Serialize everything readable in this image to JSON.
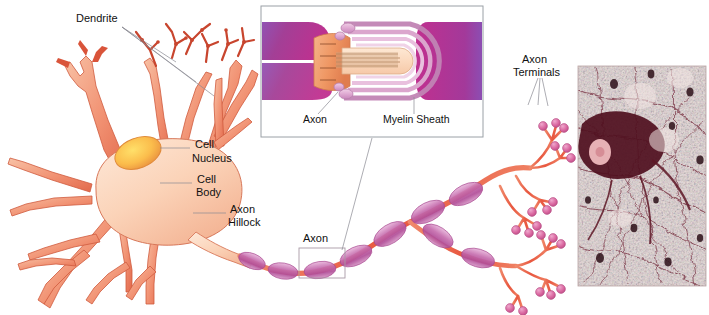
{
  "figure": {
    "background_color": "#ffffff",
    "width": 709,
    "height": 315
  },
  "labels": {
    "dendrite": "Dendrite",
    "cell_nucleus_line1": "Cell",
    "cell_nucleus_line2": "Nucleus",
    "cell_body_line1": "Cell",
    "cell_body_line2": "Body",
    "axon_hillock_line1": "Axon",
    "axon_hillock_line2": "Hillock",
    "axon_callout": "Axon",
    "axon_terminals_line1": "Axon",
    "axon_terminals_line2": "Terminals",
    "inset_axon": "Axon",
    "inset_myelin_sheath": "Myelin Sheath"
  },
  "colors": {
    "soma_fill_light": "#fbd9c4",
    "soma_fill_mid": "#f6bda0",
    "dendrite": "#ef8466",
    "dendrite_dark": "#d9543a",
    "nucleus_outer": "#f0a355",
    "nucleus_inner": "#ffd24a",
    "myelin_segment": "#c466a8",
    "myelin_segment_light": "#e3aed2",
    "axon_red": "#e8604a",
    "terminal_bulb": "#d9669f",
    "inset_myelin_dark": "#b2338c",
    "inset_myelin_purple": "#8b52b5",
    "inset_wrap_pink": "#e7b4d6",
    "inset_core_peach": "#fbdcc0",
    "node_orange": "#f0a070",
    "leader_line": "#8a8a92",
    "inset_border": "#9aa0a6",
    "text": "#111111",
    "micrograph_base": "#e9d8d8",
    "micrograph_fiber": "#7d3848",
    "micrograph_soma": "#5c1020"
  },
  "regions": {
    "neuron_cell": {
      "name": "neuron-cell-drawing",
      "x": 0,
      "y": 0,
      "width": 575,
      "height": 315
    },
    "inset_panel": {
      "name": "myelin-inset-panel",
      "x": 261,
      "y": 6,
      "width": 222,
      "height": 131
    },
    "axon_callout_box": {
      "name": "axon-callout-box",
      "x": 299,
      "y": 248,
      "width": 46,
      "height": 30
    },
    "micrograph": {
      "name": "neural-tissue-micrograph",
      "x": 578,
      "y": 66,
      "width": 128,
      "height": 220
    }
  },
  "inset": {
    "description": "Cross-section cutaway of a myelinated axon showing node of Ranvier and concentric myelin wrapping layers",
    "wrap_layer_count": 6
  },
  "micrograph": {
    "description": "Light micrograph of silver-stained nervous tissue showing a dark multipolar neuron soma and a dense network of fibers"
  }
}
